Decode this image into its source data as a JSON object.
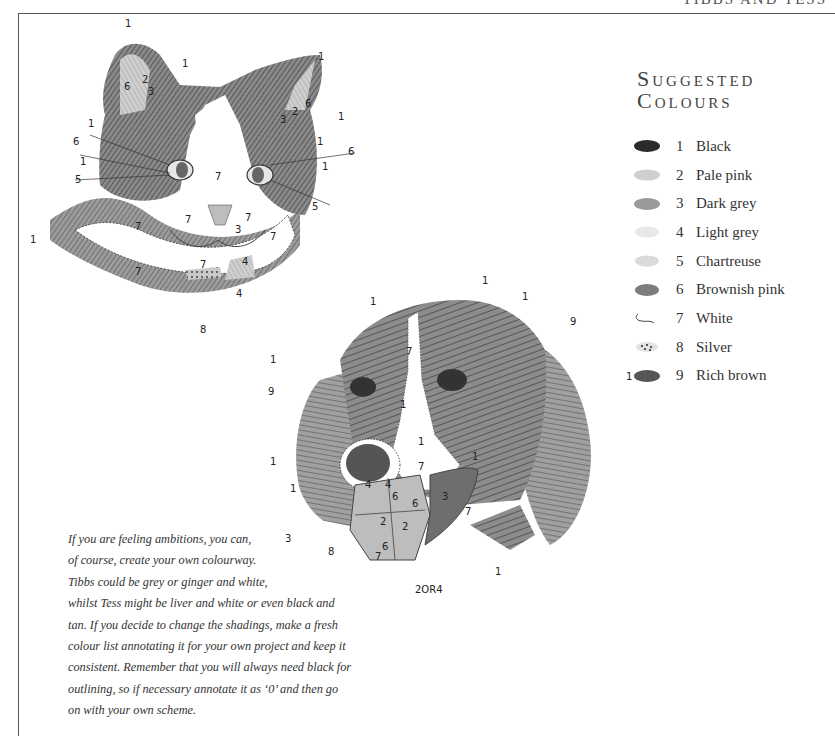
{
  "page": {
    "running_head": "TIBBS AND TESS"
  },
  "legend": {
    "title_line1": "Suggested",
    "title_line2": "Colours",
    "items": [
      {
        "number": "1",
        "label": "Black",
        "swatch": "solid",
        "color": "#2b2b2b"
      },
      {
        "number": "2",
        "label": "Pale pink",
        "swatch": "solid",
        "color": "#cfcfcf"
      },
      {
        "number": "3",
        "label": "Dark grey",
        "swatch": "solid",
        "color": "#9a9a9a"
      },
      {
        "number": "4",
        "label": "Light grey",
        "swatch": "solid",
        "color": "#e6e6e6"
      },
      {
        "number": "5",
        "label": "Chartreuse",
        "swatch": "solid",
        "color": "#d9d9d9"
      },
      {
        "number": "6",
        "label": "Brownish pink",
        "swatch": "solid",
        "color": "#7d7d7d"
      },
      {
        "number": "7",
        "label": "White",
        "swatch": "outline",
        "color": "#444444"
      },
      {
        "number": "8",
        "label": "Silver",
        "swatch": "dots",
        "color": "#bbbbbb"
      },
      {
        "number": "9",
        "label": "Rich brown",
        "swatch": "solid",
        "color": "#555555"
      }
    ]
  },
  "paragraph": {
    "lines": [
      "If you are feeling ambitions, you can,",
      "of course, create your own colourway.",
      "Tibbs could be grey or ginger and white,",
      "whilst Tess might be liver and white or even black and",
      "tan. If you decide to change the shadings, make a fresh",
      "colour list annotating it for your own project and keep it",
      "consistent. Remember that you will always need black for",
      "outlining, so if necessary annotate it as ‘0’ and then go",
      "on with your own scheme."
    ]
  },
  "illustrations": {
    "cat": {
      "name": "Tibbs",
      "labels": [
        "1",
        "1",
        "1",
        "1",
        "1",
        "1",
        "1",
        "1",
        "1",
        "6",
        "2",
        "3",
        "2",
        "3",
        "6",
        "6",
        "6",
        "5",
        "5",
        "7",
        "7",
        "7",
        "7",
        "7",
        "7",
        "7",
        "7",
        "3",
        "4",
        "4",
        "8"
      ]
    },
    "dog": {
      "name": "Tess",
      "labels": [
        "1",
        "1",
        "1",
        "9",
        "1",
        "9",
        "1",
        "1",
        "1",
        "1",
        "1",
        "1",
        "1",
        "7",
        "7",
        "7",
        "7",
        "6",
        "6",
        "2",
        "2",
        "6",
        "3",
        "3",
        "8",
        "4",
        "4",
        "1",
        "2 OR 4"
      ]
    }
  }
}
